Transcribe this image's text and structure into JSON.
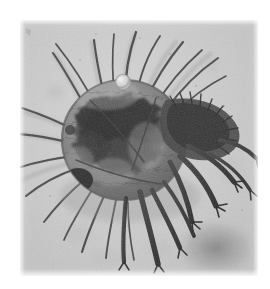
{
  "page": {
    "background_color": "#ffffff",
    "caption": ""
  },
  "figure": {
    "name": "mite-photomicrograph",
    "kind": "light-microscopy-photomicrograph",
    "color_mode": "grayscale",
    "plate": {
      "left": 20,
      "top": 20,
      "width": 238,
      "height": 256,
      "background_color": "#c9c9c9",
      "noise": "fine-grain"
    },
    "palette": {
      "background_light": "#d2d2d2",
      "background_mid": "#c4c4c4",
      "background_dark": "#b2b2b2",
      "cuticle_light": "#9a9a9a",
      "cuticle_mid": "#6e6e6e",
      "cuticle_dark": "#4a4a4a",
      "gut_darkest": "#262626",
      "seta_stroke": "#3b3b3b",
      "leg_stroke": "#2f2f2f",
      "highlight": "#e6e6e6"
    },
    "body": {
      "center_x": 104,
      "center_y": 120,
      "radius_x": 62,
      "radius_y": 60,
      "note": "rounded idiosoma, dark opaque gut mass in centre"
    },
    "features": [
      {
        "name": "dorsal-setae-fan",
        "count": 9,
        "direction": "upper-left to upper-right"
      },
      {
        "name": "lateral-setae-fan",
        "count": 6,
        "direction": "left"
      },
      {
        "name": "ventral-setae-fan",
        "count": 5,
        "direction": "lower-left"
      },
      {
        "name": "leg-cluster-right",
        "count": 5,
        "direction": "right and lower-right"
      },
      {
        "name": "leg-cluster-ventral",
        "count": 4,
        "direction": "down"
      },
      {
        "name": "gnathosoma-dark-patch",
        "position": "lower-left of idiosoma"
      },
      {
        "name": "air-bubble-artifact",
        "cx": 103,
        "cy": 62,
        "r": 7
      },
      {
        "name": "out-of-focus-blur",
        "position": "lower-right corner"
      }
    ]
  }
}
